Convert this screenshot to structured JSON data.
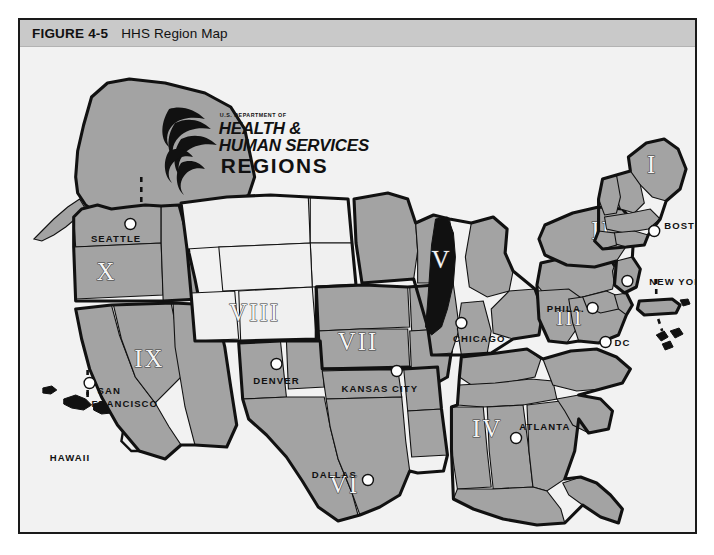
{
  "figure": {
    "number": "FIGURE 4-5",
    "title": "HHS Region Map"
  },
  "logo": {
    "department": "U.S. DEPARTMENT OF",
    "line1": "HEALTH &",
    "line2": "HUMAN SERVICES",
    "line3": "REGIONS",
    "emblem": "hhs-bird-emblem"
  },
  "colors": {
    "caption_bar": "#c9c9c9",
    "map_background": "#f2f2f2",
    "region_shaded": "#a3a3a3",
    "region_light": "#f0f0f0",
    "outline": "#111111",
    "lake": "#111111",
    "city_dot": "#ffffff"
  },
  "map": {
    "regions": [
      {
        "id": "I",
        "numeral": "I",
        "headquarters": "BOSTON",
        "shaded": true,
        "x": 636,
        "y": 117
      },
      {
        "id": "II",
        "numeral": "II",
        "headquarters": "NEW YORK",
        "shaded": true,
        "x": 585,
        "y": 183
      },
      {
        "id": "III",
        "numeral": "III",
        "headquarters": "PHILA.",
        "shaded": true,
        "x": 553,
        "y": 270
      },
      {
        "id": "IV",
        "numeral": "IV",
        "headquarters": "ATLANTA",
        "shaded": true,
        "x": 470,
        "y": 380
      },
      {
        "id": "V",
        "numeral": "V",
        "headquarters": "CHICAGO",
        "shaded": true,
        "x": 424,
        "y": 212
      },
      {
        "id": "VI",
        "numeral": "VI",
        "headquarters": "DALLAS",
        "shaded": true,
        "x": 326,
        "y": 421
      },
      {
        "id": "VII",
        "numeral": "VII",
        "headquarters": "KANSAS CITY",
        "shaded": true,
        "x": 340,
        "y": 295
      },
      {
        "id": "VIII",
        "numeral": "VIII",
        "headquarters": "DENVER",
        "shaded": false,
        "x": 236,
        "y": 265
      },
      {
        "id": "IX",
        "numeral": "IX",
        "headquarters": "SAN FRANCISCO",
        "shaded": true,
        "x": 128,
        "y": 310
      },
      {
        "id": "X",
        "numeral": "X",
        "headquarters": "SEATTLE",
        "shaded": true,
        "x": 87,
        "y": 224
      }
    ],
    "cities": [
      {
        "name": "SEATTLE",
        "region": "X",
        "label_x": 122,
        "label_y": 191,
        "align": "end",
        "dot_x": 111,
        "dot_y": 177
      },
      {
        "name": "SAN FRANCISCO",
        "region": "IX",
        "label_x": 72,
        "label_y": 346,
        "align": "start",
        "dot_x": 70,
        "dot_y": 336
      },
      {
        "name": "DENVER",
        "region": "VIII",
        "label_x": 258,
        "label_y": 335,
        "align": "middle",
        "dot_x": 258,
        "dot_y": 317
      },
      {
        "name": "DALLAS",
        "region": "VI",
        "label_x": 339,
        "label_y": 429,
        "align": "end",
        "dot_x": 350,
        "dot_y": 433
      },
      {
        "name": "KANSAS CITY",
        "region": "VII",
        "label_x": 362,
        "label_y": 344,
        "align": "middle",
        "dot_x": 379,
        "dot_y": 324
      },
      {
        "name": "CHICAGO",
        "region": "V",
        "label_x": 462,
        "label_y": 293,
        "align": "middle",
        "dot_x": 444,
        "dot_y": 276
      },
      {
        "name": "ATLANTA",
        "region": "IV",
        "label_x": 528,
        "label_y": 386,
        "align": "middle",
        "dot_x": 499,
        "dot_y": 391
      },
      {
        "name": "ATLANTA_DOT",
        "region": "IV",
        "label_x": 0,
        "label_y": 0,
        "align": "middle",
        "dot_x": 499,
        "dot_y": 391
      },
      {
        "name": "PHILA.",
        "region": "III",
        "label_x": 568,
        "label_y": 265,
        "align": "end",
        "dot_x": 576,
        "dot_y": 261
      },
      {
        "name": "DC",
        "region": "III",
        "label_x": 598,
        "label_y": 299,
        "align": "start",
        "dot_x": 589,
        "dot_y": 295
      },
      {
        "name": "NEW YORK",
        "region": "II",
        "label_x": 633,
        "label_y": 233,
        "align": "start",
        "dot_x": 611,
        "dot_y": 234
      },
      {
        "name": "BOSTON",
        "region": "I",
        "label_x": 648,
        "label_y": 185,
        "align": "start",
        "dot_x": 638,
        "dot_y": 184
      }
    ],
    "insets": [
      {
        "name": "ALASKA",
        "label": "",
        "connects_to": "SEATTLE"
      },
      {
        "name": "HAWAII",
        "label": "HAWAII",
        "label_x": 30,
        "label_y": 414,
        "connects_to": "SAN FRANCISCO"
      },
      {
        "name": "PUERTO RICO",
        "label": "",
        "connects_to": "NEW YORK"
      },
      {
        "name": "US VIRGIN ISLANDS",
        "label": "",
        "connects_to": "NEW YORK"
      }
    ],
    "features": [
      {
        "name": "LAKE MICHIGAN",
        "type": "lake"
      }
    ]
  }
}
